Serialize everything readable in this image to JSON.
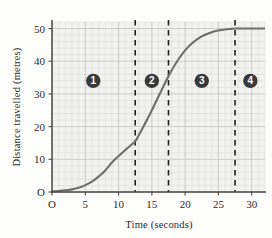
{
  "chart_data": {
    "type": "line",
    "title": "",
    "xlabel": "Time (seconds)",
    "ylabel": "Distance travelled (metres)",
    "xlim": [
      0,
      32
    ],
    "ylim": [
      0,
      52
    ],
    "xticks": [
      "O",
      "5",
      "10",
      "15",
      "20",
      "25",
      "30"
    ],
    "xtick_values": [
      0,
      5,
      10,
      15,
      20,
      25,
      30
    ],
    "yticks": [
      "O",
      "10",
      "20",
      "30",
      "40",
      "50"
    ],
    "ytick_values": [
      0,
      10,
      20,
      30,
      40,
      50
    ],
    "grid": true,
    "grid_major_step_x": 5,
    "grid_major_step_y": 10,
    "grid_minor_step_x": 1,
    "grid_minor_step_y": 2,
    "legend": "none",
    "curve_color": "#6e6e6e",
    "grid_color": "#c9c9c9",
    "axis_color": "#444444",
    "marker_color": "#3a3a3a",
    "series": [
      {
        "name": "Distance travelled",
        "x": [
          0,
          1,
          2,
          3,
          4,
          5,
          6,
          7,
          8,
          9,
          10,
          11,
          12,
          12.5,
          13,
          14,
          15,
          16,
          17,
          17.5,
          18,
          19,
          20,
          21,
          22,
          23,
          24,
          25,
          26,
          27,
          27.5,
          28,
          29,
          30,
          31,
          32
        ],
        "y": [
          0.2,
          0.3,
          0.5,
          0.8,
          1.3,
          2.1,
          3.2,
          4.7,
          6.6,
          9.0,
          11.0,
          12.8,
          14.6,
          15.5,
          17.2,
          21.0,
          25.0,
          29.2,
          33.4,
          35.4,
          37.3,
          40.6,
          43.3,
          45.4,
          47.0,
          48.1,
          48.9,
          49.4,
          49.7,
          49.9,
          50.0,
          50.0,
          50.0,
          50.0,
          50.0,
          50.0
        ]
      }
    ],
    "dashed_lines": [
      {
        "label": "boundary-1",
        "x": 12.5
      },
      {
        "label": "boundary-2",
        "x": 17.5
      },
      {
        "label": "boundary-3",
        "x": 27.5
      }
    ],
    "region_markers": [
      {
        "label": "1",
        "x": 6.2,
        "y": 34
      },
      {
        "label": "2",
        "x": 15.0,
        "y": 34
      },
      {
        "label": "3",
        "x": 22.5,
        "y": 34
      },
      {
        "label": "4",
        "x": 29.8,
        "y": 34
      }
    ]
  }
}
